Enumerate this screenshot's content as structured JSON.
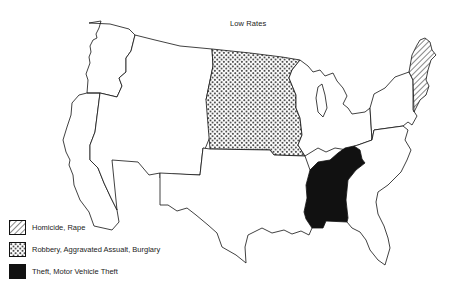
{
  "title": "Low Rates",
  "legend": {
    "items": [
      {
        "label": "Homicide, Rape",
        "pattern": "hatch",
        "icon": "diagonal-hatch-swatch"
      },
      {
        "label": "Robbery, Aggravated Assualt, Burglary",
        "pattern": "dots",
        "icon": "dotted-swatch"
      },
      {
        "label": "Theft, Motor Vehicle Theft",
        "pattern": "solid",
        "icon": "solid-black-swatch"
      }
    ]
  },
  "regions": [
    {
      "name": "New England",
      "category": "Homicide, Rape",
      "pattern": "hatch"
    },
    {
      "name": "West North Central",
      "category": "Robbery, Aggravated Assualt, Burglary",
      "pattern": "dots"
    },
    {
      "name": "East South Central",
      "category": "Theft, Motor Vehicle Theft",
      "pattern": "solid"
    },
    {
      "name": "Pacific",
      "category": "",
      "pattern": "none"
    },
    {
      "name": "Mountain",
      "category": "",
      "pattern": "none"
    },
    {
      "name": "West South Central",
      "category": "",
      "pattern": "none"
    },
    {
      "name": "East North Central",
      "category": "",
      "pattern": "none"
    },
    {
      "name": "Middle Atlantic",
      "category": "",
      "pattern": "none"
    },
    {
      "name": "South Atlantic",
      "category": "",
      "pattern": "none"
    }
  ],
  "colors": {
    "ink": "#111111",
    "background": "#ffffff"
  }
}
